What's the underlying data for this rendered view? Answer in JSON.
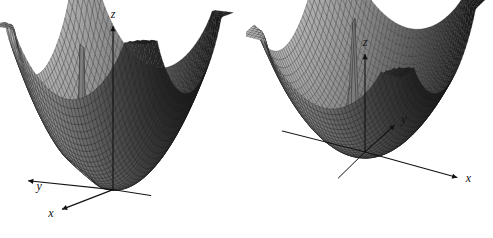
{
  "figure": {
    "background_color": "#ffffff",
    "width": 493,
    "height": 238,
    "panel_count": 2
  },
  "chart_data": [
    {
      "type": "surface",
      "id": "left-surface-plot",
      "title": "",
      "subtitle": "",
      "xlabel": "x",
      "ylabel": "y",
      "zlabel": "z",
      "axis_labels": {
        "x": "x",
        "y": "y",
        "z": "z"
      },
      "view": {
        "azimuth_deg": -60,
        "elevation_deg": 12,
        "label": "low elevation bowl view"
      },
      "xlim": [
        -2.2,
        2.2
      ],
      "ylim": [
        -2.2,
        2.2
      ],
      "zlim": [
        0,
        9
      ],
      "grid": true,
      "mesh": {
        "rows": 44,
        "cols": 44,
        "line_color": "#1a1a1a",
        "face_color": "#b4b4b4",
        "shadow_color": "#0d0d0d"
      },
      "legend": {
        "visible": false,
        "position": "none"
      },
      "annotations": [],
      "description": "Grayscale wireframe bowl-shaped surface with four tall corner spikes and one interior spike rising from the basin.",
      "surface": {
        "formula": "bowl with poles",
        "bowl_coefficient": 1.15,
        "poles": [
          {
            "x": -2.0,
            "y": -2.0,
            "strength": 0.085
          },
          {
            "x": 2.0,
            "y": -2.0,
            "strength": 0.085
          },
          {
            "x": -2.0,
            "y": 2.0,
            "strength": 0.085
          },
          {
            "x": 2.0,
            "y": 2.0,
            "strength": 0.085
          },
          {
            "x": -0.62,
            "y": 0.55,
            "strength": 0.02
          }
        ]
      }
    },
    {
      "type": "surface",
      "id": "right-surface-plot",
      "title": "",
      "subtitle": "",
      "xlabel": "x",
      "ylabel": "y",
      "zlabel": "z",
      "axis_labels": {
        "x": "x",
        "y": "y",
        "z": "z"
      },
      "view": {
        "azimuth_deg": 28,
        "elevation_deg": 30,
        "label": "higher elevation view into basin"
      },
      "xlim": [
        -2.2,
        2.2
      ],
      "ylim": [
        -2.2,
        2.2
      ],
      "zlim": [
        0,
        9
      ],
      "grid": true,
      "mesh": {
        "rows": 44,
        "cols": 44,
        "line_color": "#1a1a1a",
        "face_color": "#b4b4b4",
        "shadow_color": "#0d0d0d"
      },
      "legend": {
        "visible": false,
        "position": "none"
      },
      "annotations": [],
      "description": "Same grayscale wireframe bowl surface viewed from a higher angle so the interior basin and the ridge of the interior spike are visible.",
      "surface": {
        "formula": "bowl with poles",
        "bowl_coefficient": 1.15,
        "poles": [
          {
            "x": -2.0,
            "y": -2.0,
            "strength": 0.085
          },
          {
            "x": 2.0,
            "y": -2.0,
            "strength": 0.085
          },
          {
            "x": -2.0,
            "y": 2.0,
            "strength": 0.085
          },
          {
            "x": 2.0,
            "y": 2.0,
            "strength": 0.085
          },
          {
            "x": -0.62,
            "y": 0.55,
            "strength": 0.02
          }
        ]
      }
    }
  ]
}
